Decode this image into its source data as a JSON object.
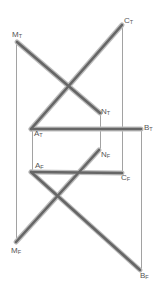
{
  "diagram": {
    "type": "descriptive-geometry-projection",
    "colors": {
      "projector": "#8a8a8a",
      "segment": "#6e6e6e",
      "segment_halo": "#b8b8b8",
      "label": "#555555"
    },
    "top_view": {
      "segments": [
        {
          "name": "MN",
          "from": "M_T",
          "to": "N_T"
        },
        {
          "name": "AC",
          "from": "A_T",
          "to": "C_T"
        },
        {
          "name": "AB",
          "from": "A_T",
          "to": "B_T"
        }
      ],
      "points": {
        "M_T": {
          "label": "M",
          "sub": "T",
          "x": 17,
          "y": 42
        },
        "N_T": {
          "label": "N",
          "sub": "T",
          "x": 100,
          "y": 113
        },
        "C_T": {
          "label": "C",
          "sub": "T",
          "x": 122,
          "y": 25
        },
        "A_T": {
          "label": "A",
          "sub": "T",
          "x": 31,
          "y": 129
        },
        "B_T": {
          "label": "B",
          "sub": "T",
          "x": 141,
          "y": 129
        }
      }
    },
    "front_view": {
      "segments": [
        {
          "name": "MN",
          "from": "M_F",
          "to": "N_F"
        },
        {
          "name": "AC",
          "from": "A_F",
          "to": "C_F"
        },
        {
          "name": "AB",
          "from": "A_F",
          "to": "B_F"
        }
      ],
      "points": {
        "A_F": {
          "label": "A",
          "sub": "F",
          "x": 31,
          "y": 172
        },
        "C_F": {
          "label": "C",
          "sub": "F",
          "x": 122,
          "y": 173
        },
        "N_F": {
          "label": "N",
          "sub": "F",
          "x": 99,
          "y": 150
        },
        "M_F": {
          "label": "M",
          "sub": "F",
          "x": 16,
          "y": 242
        },
        "B_F": {
          "label": "B",
          "sub": "F",
          "x": 140,
          "y": 270
        }
      }
    },
    "labels": {
      "M_T": "M",
      "M_T_sub": "T",
      "N_T": "N",
      "N_T_sub": "T",
      "C_T": "C",
      "C_T_sub": "T",
      "A_T": "A",
      "A_T_sub": "T",
      "B_T": "B",
      "B_T_sub": "T",
      "A_F": "A",
      "A_F_sub": "F",
      "C_F": "C",
      "C_F_sub": "F",
      "N_F": "N",
      "N_F_sub": "F",
      "M_F": "M",
      "M_F_sub": "F",
      "B_F": "B",
      "B_F_sub": "F"
    }
  }
}
